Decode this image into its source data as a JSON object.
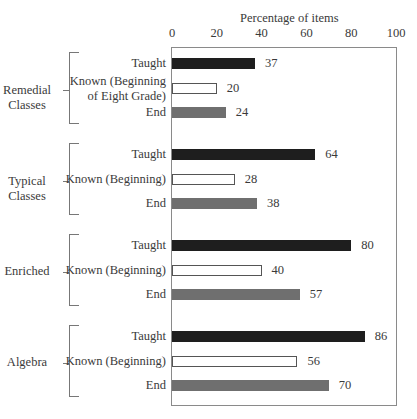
{
  "chart_data": {
    "type": "bar",
    "orientation": "horizontal",
    "title": "",
    "xlabel": "Percentage of items",
    "ylabel": "",
    "xlim": [
      0,
      100
    ],
    "x_ticks": [
      "0",
      "20",
      "40",
      "60",
      "80",
      "100"
    ],
    "grid": false,
    "legend": null,
    "groups": [
      {
        "name": "Remedial Classes",
        "label_lines": [
          "Remedial",
          "Classes"
        ],
        "bars": [
          {
            "category": "Taught",
            "label_lines": [
              "Taught"
            ],
            "value": 37,
            "style": "taught"
          },
          {
            "category": "Known (Beginning of Eight Grade)",
            "label_lines": [
              "Known (Beginning",
              "of Eight Grade)"
            ],
            "value": 20,
            "style": "known"
          },
          {
            "category": "End",
            "label_lines": [
              "End"
            ],
            "value": 24,
            "style": "end"
          }
        ]
      },
      {
        "name": "Typical Classes",
        "label_lines": [
          "Typical",
          "Classes"
        ],
        "bars": [
          {
            "category": "Taught",
            "label_lines": [
              "Taught"
            ],
            "value": 64,
            "style": "taught"
          },
          {
            "category": "Known (Beginning)",
            "label_lines": [
              "Known (Beginning)"
            ],
            "value": 28,
            "style": "known"
          },
          {
            "category": "End",
            "label_lines": [
              "End"
            ],
            "value": 38,
            "style": "end"
          }
        ]
      },
      {
        "name": "Enriched",
        "label_lines": [
          "Enriched"
        ],
        "bars": [
          {
            "category": "Taught",
            "label_lines": [
              "Taught"
            ],
            "value": 80,
            "style": "taught"
          },
          {
            "category": "Known (Beginning)",
            "label_lines": [
              "Known (Beginning)"
            ],
            "value": 40,
            "style": "known"
          },
          {
            "category": "End",
            "label_lines": [
              "End"
            ],
            "value": 57,
            "style": "end"
          }
        ]
      },
      {
        "name": "Algebra",
        "label_lines": [
          "Algebra"
        ],
        "bars": [
          {
            "category": "Taught",
            "label_lines": [
              "Taught"
            ],
            "value": 86,
            "style": "taught"
          },
          {
            "category": "Known (Beginning)",
            "label_lines": [
              "Known (Beginning)"
            ],
            "value": 56,
            "style": "known"
          },
          {
            "category": "End",
            "label_lines": [
              "End"
            ],
            "value": 70,
            "style": "end"
          }
        ]
      }
    ],
    "series_colors": {
      "taught": "#1e1e1e",
      "known": "#ffffff",
      "end": "#6f6f6f"
    }
  }
}
